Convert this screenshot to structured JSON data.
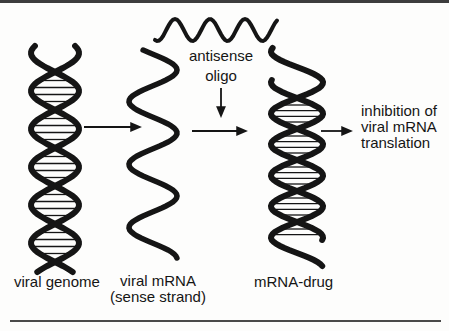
{
  "figure": {
    "antisense_label": {
      "line1": "antisense",
      "line2": "oligo"
    },
    "stage_labels": {
      "viral_genome": "viral genome",
      "viral_mrna_name": "viral mRNA",
      "viral_mrna_qualifier": "(sense strand)",
      "mrna_drug": "mRNA-drug"
    },
    "outcome_label": {
      "line1": "inhibition of",
      "line2": "viral mRNA",
      "line3": "translation"
    }
  },
  "icons": {
    "viral_genome_helix": "double-helix-icon",
    "viral_mrna_strand": "single-wavy-strand-icon",
    "antisense_oligo_wave": "short-horizontal-wave-icon",
    "mrna_drug_helix": "double-helix-duplex-icon",
    "arrow_genome_to_mrna": "right-arrow-icon",
    "arrow_mrna_to_drug": "right-arrow-icon",
    "arrow_oligo_binding": "down-arrow-icon",
    "arrow_drug_to_inhibition": "right-arrow-icon"
  },
  "colors": {
    "ink": "#151515",
    "background": "#fdfdfc",
    "top_rule": "#3d3d3d",
    "bottom_rule": "#4a4a4a"
  }
}
